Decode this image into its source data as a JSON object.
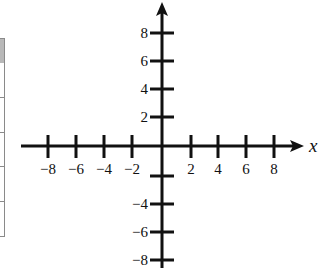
{
  "diagram": {
    "type": "coordinate-plane",
    "x_axis": {
      "label": "x",
      "ticks": [
        {
          "value": -8,
          "label": "−8",
          "px": 48
        },
        {
          "value": -6,
          "label": "−6",
          "px": 76
        },
        {
          "value": -4,
          "label": "−4",
          "px": 104
        },
        {
          "value": -2,
          "label": "−2",
          "px": 132
        },
        {
          "value": 2,
          "label": "2",
          "px": 191
        },
        {
          "value": 4,
          "label": "4",
          "px": 218
        },
        {
          "value": 6,
          "label": "6",
          "px": 246
        },
        {
          "value": 8,
          "label": "8",
          "px": 274
        }
      ]
    },
    "y_axis": {
      "label": "",
      "ticks": [
        {
          "value": 8,
          "label": "8",
          "px": 33
        },
        {
          "value": 6,
          "label": "6",
          "px": 61
        },
        {
          "value": 4,
          "label": "4",
          "px": 89
        },
        {
          "value": 2,
          "label": "2",
          "px": 117
        },
        {
          "value": -2,
          "label": "",
          "px": 176
        },
        {
          "value": -4,
          "label": "−4",
          "px": 204
        },
        {
          "value": -6,
          "label": "−6",
          "px": 232
        },
        {
          "value": -8,
          "label": "−8",
          "px": 260
        }
      ]
    },
    "origin_px": {
      "x": 162,
      "y": 146
    },
    "colors": {
      "axis": "#111111",
      "table_border": "#8a8a8a",
      "table_header": "#b8b8b8"
    }
  }
}
